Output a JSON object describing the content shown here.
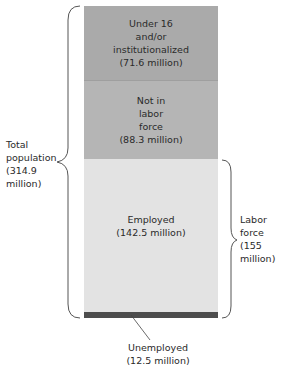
{
  "diagram": {
    "type": "stacked-block",
    "segments": [
      {
        "id": "under16",
        "label": "Under 16\nand/or\ninstitutionalized\n(71.6 million)",
        "value_millions": 71.6,
        "color": "#aaaaaa"
      },
      {
        "id": "not_in_labor_force",
        "label": "Not in\nlabor\nforce\n(88.3 million)",
        "value_millions": 88.3,
        "color": "#b5b5b5"
      },
      {
        "id": "employed",
        "label": "Employed\n(142.5 million)",
        "value_millions": 142.5,
        "color": "#e3e3e3"
      },
      {
        "id": "unemployed",
        "label": "Unemployed\n(12.5 million)",
        "value_millions": 12.5,
        "color": "#4d4d4d"
      }
    ],
    "brackets": {
      "total_population": {
        "label": "Total\npopulation\n(314.9\nmillion)",
        "value_millions": 314.9
      },
      "labor_force": {
        "label": "Labor\nforce\n(155\nmillion)",
        "value_millions": 155
      }
    }
  }
}
